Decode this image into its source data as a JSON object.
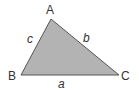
{
  "diagram": {
    "type": "triangle",
    "fill_color": "#b3b3b3",
    "stroke_color": "#555555",
    "vertices": {
      "A": {
        "label": "A",
        "x": 51,
        "y": 19
      },
      "B": {
        "label": "B",
        "x": 21,
        "y": 75
      },
      "C": {
        "label": "C",
        "x": 119,
        "y": 75
      }
    },
    "sides": {
      "a": {
        "label": "a",
        "between": "B-C"
      },
      "b": {
        "label": "b",
        "between": "A-C"
      },
      "c": {
        "label": "c",
        "between": "A-B"
      }
    }
  }
}
